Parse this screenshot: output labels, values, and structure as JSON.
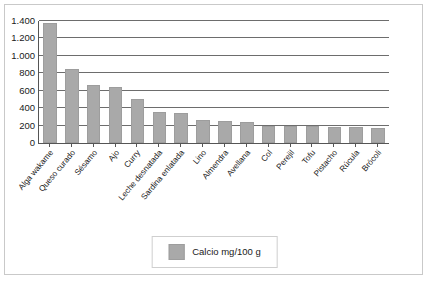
{
  "chart_data": {
    "type": "bar",
    "title": "",
    "subtitle": "",
    "xlabel": "",
    "ylabel": "",
    "ylim": [
      0,
      1400
    ],
    "yticks": [
      0,
      200,
      400,
      600,
      800,
      1000,
      1200,
      1400
    ],
    "ytick_labels": [
      "0",
      "200",
      "400",
      "600",
      "800",
      "1.000",
      "1.200",
      "1.400"
    ],
    "grid": true,
    "legend_position": "bottom-center",
    "legend": [
      "Calcio mg/100 g"
    ],
    "categories": [
      "Alga wakame",
      "Queso curado",
      "Sésamo",
      "Ajo",
      "Curry",
      "Leche desnatada",
      "Sardina enlatada",
      "Lino",
      "Almendra",
      "Avellana",
      "Col",
      "Perejil",
      "Tofu",
      "Pistacho",
      "Rúcula",
      "Brócoli"
    ],
    "series": [
      {
        "name": "Calcio mg/100 g",
        "color": "#a9a9a9",
        "values": [
          1380,
          850,
          670,
          640,
          500,
          360,
          340,
          260,
          255,
          240,
          200,
          195,
          190,
          185,
          180,
          175
        ]
      }
    ]
  },
  "legend": {
    "swatch_color": "#a9a9a9",
    "label": "Calcio mg/100 g"
  },
  "axis": {
    "line_color": "#555555",
    "grid_color": "#6d6d6d"
  }
}
